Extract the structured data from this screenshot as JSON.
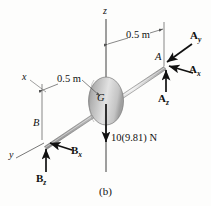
{
  "figure": {
    "caption": "(b)",
    "type": "free-body-diagram",
    "colors": {
      "line": "#1a1a1a",
      "rod_light": "#e8e8e8",
      "rod_mid": "#b8b8b8",
      "rod_dark": "#8a8a8a",
      "disk_light": "#f2f2f2",
      "disk_mid": "#c9c9c9",
      "disk_dark": "#8f8f8f",
      "background": "#fdfdfc"
    }
  },
  "axes": {
    "z": "z",
    "x": "x",
    "y": "y"
  },
  "points": {
    "A": "A",
    "B": "B",
    "G": "G"
  },
  "dimensions": {
    "right": "0.5 m",
    "left": "0.5 m"
  },
  "forces": {
    "Ay": {
      "symbol": "A",
      "sub": "y"
    },
    "Ax": {
      "symbol": "A",
      "sub": "x"
    },
    "Az": {
      "symbol": "A",
      "sub": "z"
    },
    "Bx": {
      "symbol": "B",
      "sub": "x"
    },
    "Bz": {
      "symbol": "B",
      "sub": "z"
    },
    "weight": "10(9.81) N"
  }
}
